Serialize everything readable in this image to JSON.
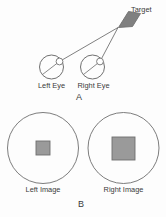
{
  "figure": {
    "background_color": "#fdfdfd",
    "stroke_color": "#6e6e6e",
    "text_color": "#3a3a3a",
    "shape_fill_color": "#9a9a9a",
    "target_fill_color": "#808080"
  },
  "panel_a": {
    "letter": "A",
    "target_label": "Target",
    "left_eye_label": "Left Eye",
    "right_eye_label": "Right Eye",
    "target": {
      "name": "target",
      "fill": "#808080",
      "points": "118.5,27.5 128.5,11.5 140.5,13.5 132.5,26.5"
    },
    "left_eye": {
      "name": "left-eye",
      "cx": 51.5,
      "cy": 67.0,
      "r": 12.0,
      "pupil_cx": 59.5,
      "pupil_cy": 61.5,
      "pupil_r": 3.4,
      "axis_x1": 42.5,
      "axis_y1": 74.5,
      "axis_x2": 62.0,
      "axis_y2": 59.5
    },
    "right_eye": {
      "name": "right-eye",
      "cx": 92.5,
      "cy": 67.0,
      "r": 12.0,
      "pupil_cx": 100.0,
      "pupil_cy": 61.5,
      "pupil_r": 3.4,
      "axis_x1": 83.5,
      "axis_y1": 74.5,
      "axis_x2": 102.5,
      "axis_y2": 59.5
    },
    "sight_lines": [
      {
        "name": "left-eye-sight-line",
        "x1": 59.5,
        "y1": 61.5,
        "x2": 118.0,
        "y2": 27.5
      },
      {
        "name": "right-eye-sight-line",
        "x1": 100.0,
        "y1": 61.5,
        "x2": 118.0,
        "y2": 27.5
      }
    ],
    "target_label_pos": {
      "x": 131.0,
      "y": 11.5
    },
    "left_eye_label_pos": {
      "x": 51.5,
      "y": 87.5
    },
    "right_eye_label_pos": {
      "x": 93.5,
      "y": 87.5
    },
    "letter_pos": {
      "x": 79.0,
      "y": 100.0
    }
  },
  "panel_b": {
    "letter": "B",
    "left_image_label": "Left Image",
    "right_image_label": "Right Image",
    "left_circle": {
      "name": "left-image-circle",
      "cx": 43.0,
      "cy": 148.0,
      "r": 35.5
    },
    "right_circle": {
      "name": "right-image-circle",
      "cx": 123.5,
      "cy": 148.0,
      "r": 35.5
    },
    "left_square": {
      "name": "left-image-square",
      "x": 36.0,
      "y": 141.0,
      "width": 14.0,
      "height": 14.0,
      "fill": "#9a9a9a"
    },
    "right_square": {
      "name": "right-image-square",
      "x": 112.0,
      "y": 137.0,
      "width": 23.0,
      "height": 23.0,
      "fill": "#9a9a9a"
    },
    "left_label_pos": {
      "x": 43.0,
      "y": 192.0
    },
    "right_label_pos": {
      "x": 123.5,
      "y": 192.0
    },
    "letter_pos": {
      "x": 81.0,
      "y": 207.0
    }
  }
}
